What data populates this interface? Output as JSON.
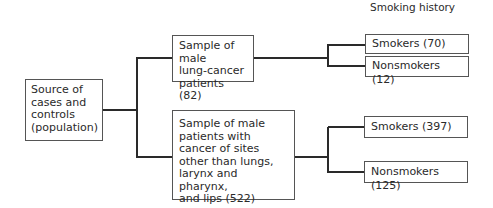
{
  "header": {
    "smoking_history_label": "Smoking history"
  },
  "nodes": {
    "source": {
      "label": "Source of\ncases and\ncontrols\n(population)"
    },
    "lung_cancer": {
      "label": "Sample of male\nlung-cancer\npatients (82)",
      "count": 82
    },
    "other_cancer": {
      "label": "Sample of male\npatients with\ncancer of sites\nother than lungs,\nlarynx and pharynx,\nand lips (522)",
      "count": 522
    },
    "lung_smokers": {
      "label": "Smokers (70)",
      "count": 70
    },
    "lung_nonsmokers": {
      "label": "Nonsmokers (12)",
      "count": 12
    },
    "other_smokers": {
      "label": "Smokers (397)",
      "count": 397
    },
    "other_nonsmokers": {
      "label": "Nonsmokers (125)",
      "count": 125
    }
  },
  "colors": {
    "line": "#2a2a2a",
    "border": "#555555"
  }
}
